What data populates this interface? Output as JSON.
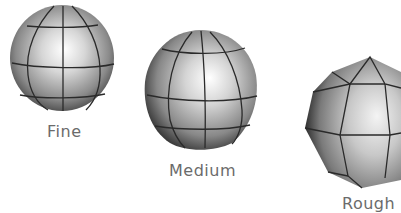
{
  "figure": {
    "items": [
      {
        "label": "Fine",
        "level": "fine"
      },
      {
        "label": "Medium",
        "level": "medium"
      },
      {
        "label": "Rough",
        "level": "rough"
      }
    ]
  },
  "colors": {
    "background": "#ffffff",
    "label": "#6b6b6b",
    "wire": "#2a2a2a",
    "highlight": "#ffffff",
    "shade_mid": "#a8a8a8",
    "shade_dark": "#3a3a3a"
  }
}
